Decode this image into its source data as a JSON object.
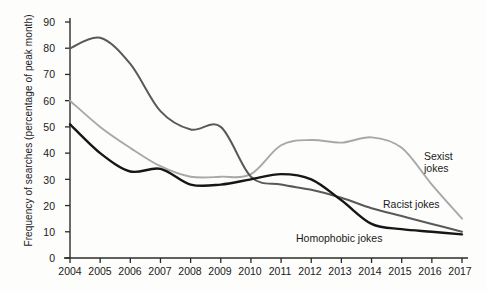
{
  "chart_data": {
    "type": "line",
    "title": "",
    "subtitle": "",
    "xlabel": "",
    "ylabel": "Frequency of searches (percentage of peak month)",
    "xlim": [
      2004,
      2017
    ],
    "ylim": [
      0,
      90
    ],
    "grid": false,
    "legend_position": "inline-right",
    "categories": [
      2004,
      2005,
      2006,
      2007,
      2008,
      2009,
      2010,
      2011,
      2012,
      2013,
      2014,
      2015,
      2016,
      2017
    ],
    "xticks": [
      "2004",
      "2005",
      "2006",
      "2007",
      "2008",
      "2009",
      "2010",
      "2011",
      "2012",
      "2013",
      "2014",
      "2015",
      "2016",
      "2017"
    ],
    "yticks": [
      "0",
      "10",
      "20",
      "30",
      "40",
      "50",
      "60",
      "70",
      "80",
      "90"
    ],
    "series": [
      {
        "name": "Sexist jokes",
        "color": "#a8a8a8",
        "label_lines": [
          "Sexist",
          "jokes"
        ],
        "values": [
          60,
          50,
          42,
          35,
          31,
          31,
          32,
          43,
          45,
          44,
          46,
          42,
          28,
          15
        ]
      },
      {
        "name": "Racist jokes",
        "color": "#595959",
        "label_lines": [
          "Racist jokes"
        ],
        "values": [
          80,
          84,
          74,
          56,
          49,
          50,
          31,
          28,
          26,
          23,
          19,
          16,
          13,
          10
        ]
      },
      {
        "name": "Homophobic jokes",
        "color": "#161616",
        "label_lines": [
          "Homophobic jokes"
        ],
        "values": [
          51,
          40,
          33,
          34,
          28,
          28,
          30,
          32,
          30,
          22,
          13,
          11,
          10,
          9
        ]
      }
    ]
  },
  "axis": {
    "y_label_text": "Frequency of searches (percentage of peak month)"
  },
  "labels": {
    "sexist_line1": "Sexist",
    "sexist_line2": "jokes",
    "racist": "Racist jokes",
    "homophobic": "Homophobic jokes"
  },
  "yticks": {
    "t0": "0",
    "t1": "10",
    "t2": "20",
    "t3": "30",
    "t4": "40",
    "t5": "50",
    "t6": "60",
    "t7": "70",
    "t8": "80",
    "t9": "90"
  },
  "xticks": {
    "t2004": "2004",
    "t2005": "2005",
    "t2006": "2006",
    "t2007": "2007",
    "t2008": "2008",
    "t2009": "2009",
    "t2010": "2010",
    "t2011": "2011",
    "t2012": "2012",
    "t2013": "2013",
    "t2014": "2014",
    "t2015": "2015",
    "t2016": "2016",
    "t2017": "2017"
  },
  "colors": {
    "sexist": "#a8a8a8",
    "racist": "#595959",
    "homophobic": "#161616",
    "axis": "#2b2b2b",
    "background": "#fdfdfc"
  }
}
